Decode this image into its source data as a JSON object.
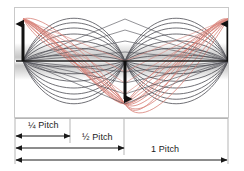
{
  "diagram": {
    "panel": {
      "border_color": "#c9c9c9",
      "background": "#ffffff"
    },
    "axis": {
      "color": "#1a1a1a",
      "y": 53,
      "x_start": 1,
      "x_end": 214,
      "gradient_band": {
        "top": 36,
        "height": 35,
        "center_color": "#ffffff",
        "edge_color": "#8a8a8a"
      }
    },
    "nodes": [
      {
        "name": "left-antinode",
        "x": 8
      },
      {
        "name": "center-node",
        "x": 110
      },
      {
        "name": "right-antinode",
        "x": 213
      }
    ],
    "arrows": [
      {
        "name": "left-up-arrow",
        "x": 8,
        "direction": "up",
        "from_y": 53,
        "to_y": 11
      },
      {
        "name": "center-down-arrow",
        "x": 110,
        "direction": "down",
        "from_y": 53,
        "to_y": 96
      },
      {
        "name": "right-up-arrow",
        "x": 213,
        "direction": "up",
        "from_y": 53,
        "to_y": 11
      }
    ],
    "wave_colors": {
      "dark": "#4a4a52",
      "red": "#d9837a"
    },
    "wave_count": 16
  },
  "dimensions": {
    "labels": [
      {
        "name": "quarter-pitch-label",
        "text": "¼ Pitch"
      },
      {
        "name": "half-pitch-label",
        "text": "½ Pitch"
      },
      {
        "name": "one-pitch-label",
        "text": "1 Pitch"
      }
    ],
    "lines": [
      {
        "name": "quarter-pitch-dimension",
        "y": 18,
        "x_start": 2,
        "x_end": 56
      },
      {
        "name": "half-pitch-dimension",
        "y": 30,
        "x_start": 2,
        "x_end": 110
      },
      {
        "name": "one-pitch-dimension",
        "y": 42,
        "x_start": 2,
        "x_end": 213
      }
    ],
    "ticks": [
      {
        "name": "tick-left",
        "x": 2
      },
      {
        "name": "tick-quarter",
        "x": 56
      },
      {
        "name": "tick-half",
        "x": 110
      },
      {
        "name": "tick-right",
        "x": 213
      }
    ],
    "line_color": "#1a1a1a",
    "guide_color": "#b5b5b5"
  }
}
